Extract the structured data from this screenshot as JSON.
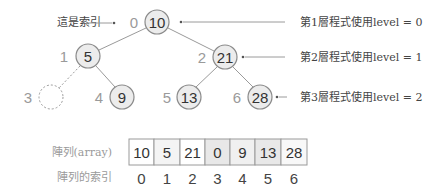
{
  "tree": {
    "index_label": "這是索引",
    "nodes": [
      {
        "index": "0",
        "value": "10"
      },
      {
        "index": "1",
        "value": "5"
      },
      {
        "index": "2",
        "value": "21"
      },
      {
        "index": "3",
        "value": ""
      },
      {
        "index": "4",
        "value": "9"
      },
      {
        "index": "5",
        "value": "13"
      },
      {
        "index": "6",
        "value": "28"
      }
    ],
    "level_labels": [
      "第1層程式使用level = 0",
      "第2層程式使用level = 1",
      "第3層程式使用level = 2"
    ]
  },
  "array": {
    "label": "陣列(array)",
    "index_label": "陣列的索引",
    "values": [
      "10",
      "5",
      "21",
      "0",
      "9",
      "13",
      "28"
    ],
    "indices": [
      "0",
      "1",
      "2",
      "3",
      "4",
      "5",
      "6"
    ]
  },
  "colors": {
    "node_fill": "#ececec",
    "node_stroke": "#8a8a8a",
    "cell_white": "#ffffff",
    "cell_light": "#f2f2f2",
    "cell_gray": "#e6e6e6"
  }
}
